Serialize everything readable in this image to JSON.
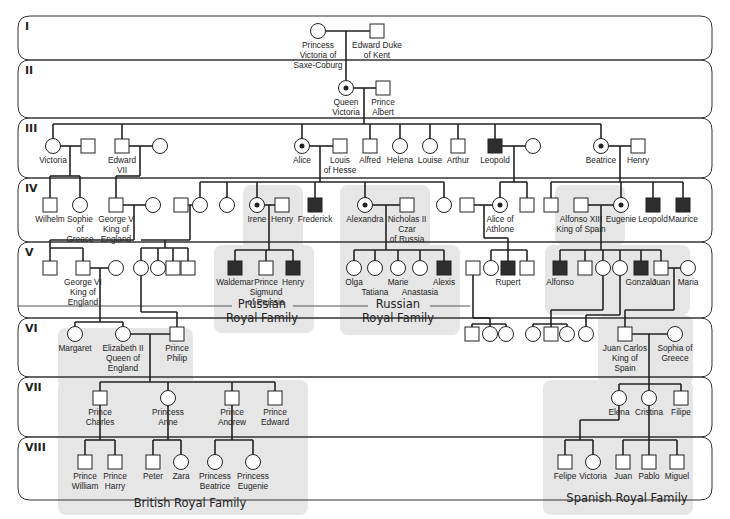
{
  "colors": {
    "affected": "#2e2e2e",
    "shade": "#e6e6e6",
    "line": "#222222"
  },
  "legend_semantics": {
    "square": "male",
    "circle": "female",
    "filled": "affected (hemophilia)",
    "dot": "carrier female"
  },
  "generations": [
    {
      "label": "I",
      "y1": 16,
      "y2": 60
    },
    {
      "label": "II",
      "y1": 60,
      "y2": 118
    },
    {
      "label": "III",
      "y1": 118,
      "y2": 178
    },
    {
      "label": "IV",
      "y1": 178,
      "y2": 242
    },
    {
      "label": "V",
      "y1": 242,
      "y2": 318
    },
    {
      "label": "VI",
      "y1": 318,
      "y2": 377
    },
    {
      "label": "VII",
      "y1": 377,
      "y2": 437
    },
    {
      "label": "VIII",
      "y1": 437,
      "y2": 500
    }
  ],
  "families": [
    {
      "label1": "Prussian",
      "label2": "Royal Family",
      "x": 262,
      "y": 312
    },
    {
      "label1": "Russian",
      "label2": "Royal Family",
      "x": 398,
      "y": 312
    },
    {
      "label1": "British Royal Family",
      "label2": "",
      "x": 190,
      "y": 507
    },
    {
      "label1": "Spanish Royal Family",
      "label2": "",
      "x": 627,
      "y": 502
    }
  ],
  "shaded_regions": [
    {
      "x": 243,
      "y": 185,
      "w": 60,
      "h": 140
    },
    {
      "x": 214,
      "y": 245,
      "w": 100,
      "h": 88
    },
    {
      "x": 340,
      "y": 185,
      "w": 90,
      "h": 150
    },
    {
      "x": 340,
      "y": 245,
      "w": 120,
      "h": 90
    },
    {
      "x": 555,
      "y": 185,
      "w": 70,
      "h": 60
    },
    {
      "x": 545,
      "y": 245,
      "w": 145,
      "h": 70
    },
    {
      "x": 598,
      "y": 315,
      "w": 95,
      "h": 70
    },
    {
      "x": 543,
      "y": 380,
      "w": 150,
      "h": 135
    },
    {
      "x": 58,
      "y": 328,
      "w": 135,
      "h": 60
    },
    {
      "x": 58,
      "y": 380,
      "w": 250,
      "h": 135
    }
  ],
  "people": [
    {
      "id": "pv",
      "name": [
        "Princess",
        "Victoria of",
        "Saxe-Coburg"
      ],
      "sex": "f",
      "status": "normal",
      "x": 318,
      "y": 31
    },
    {
      "id": "ed",
      "name": [
        "Edward Duke",
        "of Kent"
      ],
      "sex": "m",
      "status": "normal",
      "x": 377,
      "y": 31
    },
    {
      "id": "qv",
      "name": [
        "Queen",
        "Victoria"
      ],
      "sex": "f",
      "status": "carrier",
      "x": 346,
      "y": 88
    },
    {
      "id": "pa",
      "name": [
        "Prince",
        "Albert"
      ],
      "sex": "m",
      "status": "normal",
      "x": 383,
      "y": 88
    },
    {
      "id": "vic",
      "name": [
        "Victoria"
      ],
      "sex": "f",
      "status": "normal",
      "x": 53,
      "y": 146
    },
    {
      "id": "vsp",
      "name": [],
      "sex": "m",
      "status": "normal",
      "x": 88,
      "y": 146
    },
    {
      "id": "e7",
      "name": [
        "Edward",
        "VII"
      ],
      "sex": "m",
      "status": "normal",
      "x": 122,
      "y": 146
    },
    {
      "id": "e7s",
      "name": [],
      "sex": "f",
      "status": "normal",
      "x": 160,
      "y": 146
    },
    {
      "id": "al",
      "name": [
        "Alice"
      ],
      "sex": "f",
      "status": "carrier",
      "x": 302,
      "y": 146
    },
    {
      "id": "lh",
      "name": [
        "Louis",
        "of Hesse"
      ],
      "sex": "m",
      "status": "normal",
      "x": 340,
      "y": 146
    },
    {
      "id": "alf",
      "name": [
        "Alfred"
      ],
      "sex": "m",
      "status": "normal",
      "x": 370,
      "y": 146
    },
    {
      "id": "hel",
      "name": [
        "Helena"
      ],
      "sex": "f",
      "status": "normal",
      "x": 400,
      "y": 146
    },
    {
      "id": "lou",
      "name": [
        "Louise"
      ],
      "sex": "f",
      "status": "normal",
      "x": 430,
      "y": 146
    },
    {
      "id": "art",
      "name": [
        "Arthur"
      ],
      "sex": "m",
      "status": "normal",
      "x": 458,
      "y": 146
    },
    {
      "id": "leo",
      "name": [
        "Leopold"
      ],
      "sex": "m",
      "status": "affected",
      "x": 495,
      "y": 146
    },
    {
      "id": "leos",
      "name": [],
      "sex": "f",
      "status": "normal",
      "x": 533,
      "y": 146
    },
    {
      "id": "bea",
      "name": [
        "Beatrice"
      ],
      "sex": "f",
      "status": "carrier",
      "x": 601,
      "y": 146
    },
    {
      "id": "hen",
      "name": [
        "Henry"
      ],
      "sex": "m",
      "status": "normal",
      "x": 638,
      "y": 146
    },
    {
      "id": "wil",
      "name": [
        "Wilhelm"
      ],
      "sex": "m",
      "status": "normal",
      "x": 50,
      "y": 205
    },
    {
      "id": "sop",
      "name": [
        "Sophie",
        "of",
        "Greece"
      ],
      "sex": "f",
      "status": "normal",
      "x": 80,
      "y": 205
    },
    {
      "id": "g5",
      "name": [
        "George V",
        "King of",
        "England"
      ],
      "sex": "m",
      "status": "normal",
      "x": 116,
      "y": 205
    },
    {
      "id": "g5s",
      "name": [],
      "sex": "f",
      "status": "normal",
      "x": 153,
      "y": 205
    },
    {
      "id": "a4m",
      "name": [],
      "sex": "m",
      "status": "normal",
      "x": 181,
      "y": 205
    },
    {
      "id": "a4f",
      "name": [],
      "sex": "f",
      "status": "normal",
      "x": 200,
      "y": 205
    },
    {
      "id": "a4g",
      "name": [],
      "sex": "f",
      "status": "normal",
      "x": 227,
      "y": 205
    },
    {
      "id": "ire",
      "name": [
        "Irene"
      ],
      "sex": "f",
      "status": "carrier",
      "x": 257,
      "y": 205
    },
    {
      "id": "ihe",
      "name": [
        "Henry"
      ],
      "sex": "m",
      "status": "normal",
      "x": 282,
      "y": 205
    },
    {
      "id": "fre",
      "name": [
        "Frederick"
      ],
      "sex": "m",
      "status": "affected",
      "x": 315,
      "y": 205
    },
    {
      "id": "ale",
      "name": [
        "Alexandra"
      ],
      "sex": "f",
      "status": "carrier",
      "x": 365,
      "y": 205
    },
    {
      "id": "nic",
      "name": [
        "Nicholas II",
        "Czar",
        "of Russia"
      ],
      "sex": "m",
      "status": "normal",
      "x": 407,
      "y": 205
    },
    {
      "id": "a4h",
      "name": [],
      "sex": "f",
      "status": "normal",
      "x": 444,
      "y": 205
    },
    {
      "id": "aas",
      "name": [],
      "sex": "m",
      "status": "normal",
      "x": 467,
      "y": 205
    },
    {
      "id": "aoa",
      "name": [
        "Alice of",
        "Athlone"
      ],
      "sex": "f",
      "status": "carrier",
      "x": 500,
      "y": 205
    },
    {
      "id": "l4m",
      "name": [],
      "sex": "m",
      "status": "normal",
      "x": 527,
      "y": 205
    },
    {
      "id": "b4m",
      "name": [],
      "sex": "m",
      "status": "normal",
      "x": 551,
      "y": 205
    },
    {
      "id": "a13",
      "name": [
        "Alfonso XIII",
        "King of Spain"
      ],
      "sex": "m",
      "status": "normal",
      "x": 581,
      "y": 205
    },
    {
      "id": "eug",
      "name": [
        "Eugenie"
      ],
      "sex": "f",
      "status": "carrier",
      "x": 621,
      "y": 205
    },
    {
      "id": "bleo",
      "name": [
        "Leopold"
      ],
      "sex": "m",
      "status": "affected",
      "x": 653,
      "y": 205
    },
    {
      "id": "mau",
      "name": [
        "Maurice"
      ],
      "sex": "m",
      "status": "affected",
      "x": 683,
      "y": 205
    },
    {
      "id": "g5c1",
      "name": [],
      "sex": "m",
      "status": "normal",
      "x": 50,
      "y": 268
    },
    {
      "id": "g6",
      "name": [
        "George VI",
        "King of",
        "England"
      ],
      "sex": "m",
      "status": "normal",
      "x": 83,
      "y": 268
    },
    {
      "id": "g6s",
      "name": [],
      "sex": "f",
      "status": "normal",
      "x": 116,
      "y": 268
    },
    {
      "id": "c5a",
      "name": [],
      "sex": "f",
      "status": "normal",
      "x": 141,
      "y": 268
    },
    {
      "id": "c5b",
      "name": [],
      "sex": "f",
      "status": "normal",
      "x": 158,
      "y": 268
    },
    {
      "id": "c5c",
      "name": [],
      "sex": "m",
      "status": "normal",
      "x": 173,
      "y": 268
    },
    {
      "id": "c5d",
      "name": [],
      "sex": "m",
      "status": "normal",
      "x": 188,
      "y": 268
    },
    {
      "id": "wal",
      "name": [
        "Waldemar"
      ],
      "sex": "m",
      "status": "affected",
      "x": 235,
      "y": 268
    },
    {
      "id": "sig",
      "name": [
        "Prince",
        "Sigmund",
        "of Prussia"
      ],
      "sex": "m",
      "status": "normal",
      "x": 266,
      "y": 268
    },
    {
      "id": "phe",
      "name": [
        "Henry"
      ],
      "sex": "m",
      "status": "affected",
      "x": 293,
      "y": 268
    },
    {
      "id": "olg",
      "name": [
        "Olga"
      ],
      "sex": "f",
      "status": "normal",
      "x": 354,
      "y": 268
    },
    {
      "id": "tat",
      "name": [
        "",
        "Tatiana"
      ],
      "sex": "f",
      "status": "normal",
      "x": 375,
      "y": 268
    },
    {
      "id": "mar",
      "name": [
        "Marie"
      ],
      "sex": "f",
      "status": "normal",
      "x": 398,
      "y": 268
    },
    {
      "id": "ana",
      "name": [
        "",
        "Anastasia"
      ],
      "sex": "f",
      "status": "normal",
      "x": 420,
      "y": 268
    },
    {
      "id": "alx",
      "name": [
        "Alexis"
      ],
      "sex": "m",
      "status": "affected",
      "x": 444,
      "y": 268
    },
    {
      "id": "rsp",
      "name": [],
      "sex": "m",
      "status": "normal",
      "x": 473,
      "y": 268
    },
    {
      "id": "r5f",
      "name": [],
      "sex": "f",
      "status": "normal",
      "x": 491,
      "y": 268
    },
    {
      "id": "rup",
      "name": [
        "Rupert"
      ],
      "sex": "m",
      "status": "affected",
      "x": 508,
      "y": 268
    },
    {
      "id": "r5m",
      "name": [],
      "sex": "m",
      "status": "normal",
      "x": 527,
      "y": 268
    },
    {
      "id": "afo",
      "name": [
        "Alfonso"
      ],
      "sex": "m",
      "status": "affected",
      "x": 560,
      "y": 268
    },
    {
      "id": "s5m",
      "name": [],
      "sex": "m",
      "status": "normal",
      "x": 585,
      "y": 268
    },
    {
      "id": "s5f1",
      "name": [],
      "sex": "f",
      "status": "normal",
      "x": 603,
      "y": 268
    },
    {
      "id": "s5f2",
      "name": [],
      "sex": "f",
      "status": "normal",
      "x": 620,
      "y": 268
    },
    {
      "id": "gon",
      "name": [
        "Gonzalo"
      ],
      "sex": "m",
      "status": "affected",
      "x": 641,
      "y": 268
    },
    {
      "id": "jua",
      "name": [
        "Juan"
      ],
      "sex": "m",
      "status": "normal",
      "x": 661,
      "y": 268
    },
    {
      "id": "mra",
      "name": [
        "Maria"
      ],
      "sex": "f",
      "status": "normal",
      "x": 688,
      "y": 268
    },
    {
      "id": "mgt",
      "name": [
        "Margaret"
      ],
      "sex": "f",
      "status": "normal",
      "x": 75,
      "y": 334
    },
    {
      "id": "el2",
      "name": [
        "Elizabeth II",
        "Queen of",
        "England"
      ],
      "sex": "f",
      "status": "normal",
      "x": 123,
      "y": 334
    },
    {
      "id": "php",
      "name": [
        "Prince",
        "Philip"
      ],
      "sex": "m",
      "status": "normal",
      "x": 177,
      "y": 334
    },
    {
      "id": "r6a",
      "name": [],
      "sex": "m",
      "status": "normal",
      "x": 472,
      "y": 334
    },
    {
      "id": "r6b",
      "name": [],
      "sex": "f",
      "status": "normal",
      "x": 490,
      "y": 334
    },
    {
      "id": "r6c",
      "name": [],
      "sex": "f",
      "status": "normal",
      "x": 506,
      "y": 334
    },
    {
      "id": "s6a",
      "name": [],
      "sex": "f",
      "status": "normal",
      "x": 533,
      "y": 334
    },
    {
      "id": "s6b",
      "name": [],
      "sex": "m",
      "status": "normal",
      "x": 551,
      "y": 334
    },
    {
      "id": "s6c",
      "name": [],
      "sex": "f",
      "status": "normal",
      "x": 567,
      "y": 334
    },
    {
      "id": "s6d",
      "name": [],
      "sex": "f",
      "status": "normal",
      "x": 586,
      "y": 334
    },
    {
      "id": "jc",
      "name": [
        "Juan Carlos",
        "King of",
        "Spain"
      ],
      "sex": "m",
      "status": "normal",
      "x": 625,
      "y": 334
    },
    {
      "id": "sog",
      "name": [
        "Sophia of",
        "Greece"
      ],
      "sex": "f",
      "status": "normal",
      "x": 675,
      "y": 334
    },
    {
      "id": "cha",
      "name": [
        "Prince",
        "Charles"
      ],
      "sex": "m",
      "status": "normal",
      "x": 100,
      "y": 398
    },
    {
      "id": "ann",
      "name": [
        "Princess",
        "Anne"
      ],
      "sex": "f",
      "status": "normal",
      "x": 168,
      "y": 398
    },
    {
      "id": "and",
      "name": [
        "Prince",
        "Andrew"
      ],
      "sex": "m",
      "status": "normal",
      "x": 232,
      "y": 398
    },
    {
      "id": "edw",
      "name": [
        "Prince",
        "Edward"
      ],
      "sex": "m",
      "status": "normal",
      "x": 275,
      "y": 398
    },
    {
      "id": "ele",
      "name": [
        "Elena"
      ],
      "sex": "f",
      "status": "normal",
      "x": 619,
      "y": 398
    },
    {
      "id": "cri",
      "name": [
        "Cristina"
      ],
      "sex": "f",
      "status": "normal",
      "x": 649,
      "y": 398
    },
    {
      "id": "fil",
      "name": [
        "Filipe"
      ],
      "sex": "m",
      "status": "normal",
      "x": 681,
      "y": 398
    },
    {
      "id": "wlm",
      "name": [
        "Prince",
        "William"
      ],
      "sex": "m",
      "status": "normal",
      "x": 85,
      "y": 462
    },
    {
      "id": "har",
      "name": [
        "Prince",
        "Harry"
      ],
      "sex": "m",
      "status": "normal",
      "x": 115,
      "y": 462
    },
    {
      "id": "pet",
      "name": [
        "Peter"
      ],
      "sex": "m",
      "status": "normal",
      "x": 153,
      "y": 462
    },
    {
      "id": "zar",
      "name": [
        "Zara"
      ],
      "sex": "f",
      "status": "normal",
      "x": 181,
      "y": 462
    },
    {
      "id": "pbe",
      "name": [
        "Princess",
        "Beatrice"
      ],
      "sex": "f",
      "status": "normal",
      "x": 215,
      "y": 462
    },
    {
      "id": "peu",
      "name": [
        "Princess",
        "Eugenie"
      ],
      "sex": "f",
      "status": "normal",
      "x": 253,
      "y": 462
    },
    {
      "id": "fel",
      "name": [
        "Felipe"
      ],
      "sex": "m",
      "status": "normal",
      "x": 565,
      "y": 462
    },
    {
      "id": "vct",
      "name": [
        "Victoria"
      ],
      "sex": "f",
      "status": "normal",
      "x": 593,
      "y": 462
    },
    {
      "id": "jn8",
      "name": [
        "Juan"
      ],
      "sex": "m",
      "status": "normal",
      "x": 623,
      "y": 462
    },
    {
      "id": "pab",
      "name": [
        "Pablo"
      ],
      "sex": "m",
      "status": "normal",
      "x": 649,
      "y": 462
    },
    {
      "id": "mig",
      "name": [
        "Miguel"
      ],
      "sex": "m",
      "status": "normal",
      "x": 677,
      "y": 462
    }
  ],
  "lines": [
    "M325 31 H370",
    "M346 31 V80",
    "M353 88 H376",
    "M364 88 V124",
    "M53 124 H601",
    "M53 124 V139",
    "M122 124 V139",
    "M302 124 V139",
    "M370 124 V139",
    "M400 124 V139",
    "M430 124 V139",
    "M458 124 V139",
    "M495 124 V139",
    "M601 124 V139",
    "M60 146 H81",
    "M70 146 V176",
    "M50 176 H80",
    "M50 176 V198",
    "M80 176 V198",
    "M129 146 H153",
    "M140 146 V176",
    "M116 176 H140",
    "M116 176 V198",
    "M309 146 H333",
    "M320 146 V182",
    "M200 182 H444",
    "M200 182 V198",
    "M227 182 V198",
    "M257 182 V198",
    "M315 182 V198",
    "M365 182 V198",
    "M444 182 V198",
    "M502 146 H526",
    "M514 146 V182",
    "M500 182 H527",
    "M500 182 V198",
    "M527 182 V198",
    "M608 146 H631",
    "M620 146 V182",
    "M551 182 H683",
    "M551 182 V198",
    "M621 182 V198",
    "M653 182 V198",
    "M683 182 V198",
    "M123 205 H146",
    "M134 205 V240",
    "M50 240 H134",
    "M50 240 V248",
    "M50 248 H83",
    "M50 248 V261",
    "M83 248 V261",
    "M188 205 H193",
    "M190 205 V240",
    "M141 240 H190",
    "M165 240 V248",
    "M141 248 H188",
    "M141 248 V261",
    "M158 248 V261",
    "M173 248 V261",
    "M188 248 V261",
    "M264 205 H275",
    "M269 205 V250",
    "M235 250 H293",
    "M235 250 V261",
    "M266 250 V261",
    "M293 250 V261",
    "M372 205 H400",
    "M386 205 V250",
    "M354 250 H444",
    "M354 250 V261",
    "M375 250 V261",
    "M398 250 V261",
    "M420 250 V261",
    "M444 250 V261",
    "M474 205 H493",
    "M484 205 V238",
    "M484 238 H508",
    "M508 238 V250",
    "M491 250 H527",
    "M491 250 V261",
    "M508 250 V261",
    "M527 250 V261",
    "M588 205 H614",
    "M601 205 V250",
    "M560 250 H661",
    "M560 250 V261",
    "M585 250 V261",
    "M603 250 V261",
    "M620 250 V261",
    "M641 250 V261",
    "M661 250 V261",
    "M668 268 H681",
    "M674 268 V310",
    "M625 310 H674",
    "M625 310 V327",
    "M90 268 H109",
    "M100 268 V322",
    "M75 322 H123",
    "M75 322 V327",
    "M123 322 V327",
    "M141 275 V312",
    "M141 312 H177",
    "M177 312 V327",
    "M130 334 H170",
    "M150 334 V382",
    "M100 382 H275",
    "M100 382 V391",
    "M168 382 V391",
    "M232 382 V391",
    "M275 382 V391",
    "M473 275 V318",
    "M473 318 H490",
    "M472 324 H506",
    "M490 318 V327",
    "M472 324 V327",
    "M506 324 V327",
    "M603 275 V310",
    "M603 310 H551",
    "M551 310 V324",
    "M533 324 H567",
    "M533 324 V327",
    "M567 324 V327",
    "M551 324 V327",
    "M620 275 V315",
    "M620 315 H586",
    "M586 315 V327",
    "M632 334 H668",
    "M649 334 V384",
    "M619 384 H681",
    "M619 384 V391",
    "M649 384 V391",
    "M681 384 V391",
    "M100 405 V440",
    "M85 440 H115",
    "M85 440 V455",
    "M115 440 V455",
    "M168 405 V440",
    "M153 440 H181",
    "M153 440 V455",
    "M181 440 V455",
    "M232 405 V440",
    "M215 440 H253",
    "M215 440 V455",
    "M253 440 V455",
    "M619 405 V420",
    "M619 420 H580",
    "M580 420 V440",
    "M565 440 H593",
    "M565 440 V455",
    "M593 440 V455",
    "M649 405 V440",
    "M623 440 H677",
    "M623 440 V455",
    "M649 440 V455",
    "M677 440 V455"
  ]
}
